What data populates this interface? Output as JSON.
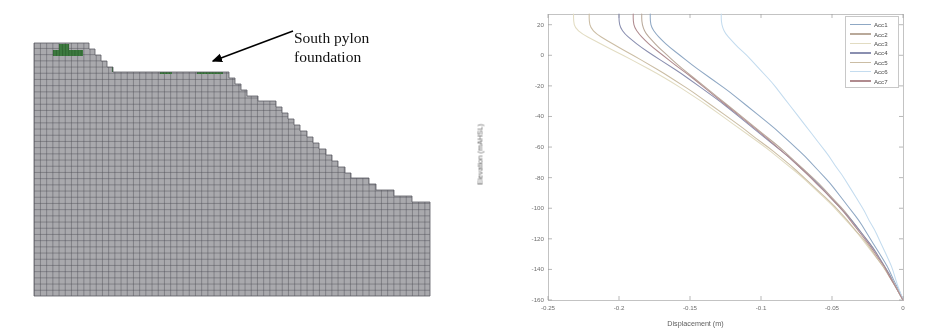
{
  "figure_left": {
    "name": "finite-element-mesh-cross-section",
    "annotation": {
      "line1": "South pylon",
      "line2": "foundation",
      "full_text": "South pylon foundation"
    },
    "mesh": {
      "fill_color": "#a9a9ad",
      "grid_color": "#4a4a52",
      "foundation_color": "#3d7a3f",
      "cell_size_px": 6.2,
      "foundation_blocks": [
        {
          "x": 59,
          "y": 44,
          "w": 10,
          "h": 6
        },
        {
          "x": 53,
          "y": 50,
          "w": 30,
          "h": 6
        },
        {
          "x": 112,
          "y": 67,
          "w": 12,
          "h": 5
        },
        {
          "x": 160,
          "y": 69,
          "w": 12,
          "h": 5
        },
        {
          "x": 197,
          "y": 67,
          "w": 26,
          "h": 7
        }
      ],
      "profile_steps": [
        {
          "x": 34,
          "y": 43
        },
        {
          "x": 83,
          "y": 43
        },
        {
          "x": 89,
          "y": 49
        },
        {
          "x": 95,
          "y": 55
        },
        {
          "x": 101,
          "y": 61
        },
        {
          "x": 107,
          "y": 67
        },
        {
          "x": 113,
          "y": 72
        },
        {
          "x": 223,
          "y": 72
        },
        {
          "x": 229,
          "y": 78
        },
        {
          "x": 235,
          "y": 84
        },
        {
          "x": 241,
          "y": 90
        },
        {
          "x": 247,
          "y": 96
        },
        {
          "x": 258,
          "y": 101
        },
        {
          "x": 270,
          "y": 101
        },
        {
          "x": 276,
          "y": 107
        },
        {
          "x": 282,
          "y": 113
        },
        {
          "x": 288,
          "y": 119
        },
        {
          "x": 294,
          "y": 125
        },
        {
          "x": 300,
          "y": 131
        },
        {
          "x": 307,
          "y": 137
        },
        {
          "x": 313,
          "y": 143
        },
        {
          "x": 319,
          "y": 149
        },
        {
          "x": 326,
          "y": 155
        },
        {
          "x": 332,
          "y": 161
        },
        {
          "x": 338,
          "y": 167
        },
        {
          "x": 345,
          "y": 173
        },
        {
          "x": 351,
          "y": 178
        },
        {
          "x": 363,
          "y": 178
        },
        {
          "x": 369,
          "y": 184
        },
        {
          "x": 376,
          "y": 190
        },
        {
          "x": 388,
          "y": 190
        },
        {
          "x": 394,
          "y": 196
        },
        {
          "x": 406,
          "y": 196
        },
        {
          "x": 412,
          "y": 202
        },
        {
          "x": 424,
          "y": 202
        },
        {
          "x": 430,
          "y": 296
        },
        {
          "x": 34,
          "y": 296
        }
      ]
    }
  },
  "chart_data": {
    "type": "line",
    "title": "",
    "xlabel": "Displacement (m)",
    "ylabel": "Elevation (mAHSL)",
    "xlim": [
      -0.25,
      0.0
    ],
    "ylim": [
      -160,
      27
    ],
    "xticks": [
      -0.25,
      -0.2,
      -0.15,
      -0.1,
      -0.05,
      0
    ],
    "xticklabels": [
      "-0.25",
      "-0.2",
      "-0.15",
      "-0.1",
      "-0.05",
      "0"
    ],
    "yticks": [
      20,
      0,
      -20,
      -40,
      -60,
      -80,
      -100,
      -120,
      -140,
      -160
    ],
    "yticklabels": [
      "20",
      "0",
      "-20",
      "-40",
      "-60",
      "-80",
      "-100",
      "-120",
      "-140",
      "-160"
    ],
    "grid": false,
    "legend_position": "top-right",
    "legend_entries": [
      "Acc1",
      "Acc2",
      "Acc3",
      "Acc4",
      "Acc5",
      "Acc6",
      "Acc7"
    ],
    "series": [
      {
        "name": "Acc1",
        "color": "#8fa8c4",
        "points": [
          [
            -0.178,
            27
          ],
          [
            -0.178,
            22
          ],
          [
            -0.177,
            18
          ],
          [
            -0.174,
            14
          ],
          [
            -0.17,
            10
          ],
          [
            -0.164,
            5
          ],
          [
            -0.157,
            0
          ],
          [
            -0.149,
            -6
          ],
          [
            -0.14,
            -12
          ],
          [
            -0.131,
            -18
          ],
          [
            -0.122,
            -24
          ],
          [
            -0.114,
            -30
          ],
          [
            -0.106,
            -36
          ],
          [
            -0.098,
            -42
          ],
          [
            -0.09,
            -48
          ],
          [
            -0.083,
            -54
          ],
          [
            -0.076,
            -60
          ],
          [
            -0.069,
            -66
          ],
          [
            -0.063,
            -72
          ],
          [
            -0.057,
            -78
          ],
          [
            -0.051,
            -84
          ],
          [
            -0.046,
            -90
          ],
          [
            -0.041,
            -96
          ],
          [
            -0.036,
            -102
          ],
          [
            -0.031,
            -108
          ],
          [
            -0.027,
            -114
          ],
          [
            -0.023,
            -120
          ],
          [
            -0.019,
            -126
          ],
          [
            -0.015,
            -132
          ],
          [
            -0.011,
            -138
          ],
          [
            -0.008,
            -144
          ],
          [
            -0.005,
            -150
          ],
          [
            -0.002,
            -155
          ],
          [
            0.0,
            -160
          ]
        ]
      },
      {
        "name": "Acc2",
        "color": "#b9a99a",
        "points": [
          [
            -0.184,
            27
          ],
          [
            -0.184,
            22
          ],
          [
            -0.183,
            18
          ],
          [
            -0.181,
            14
          ],
          [
            -0.177,
            10
          ],
          [
            -0.172,
            5
          ],
          [
            -0.166,
            0
          ],
          [
            -0.159,
            -6
          ],
          [
            -0.151,
            -12
          ],
          [
            -0.143,
            -18
          ],
          [
            -0.135,
            -24
          ],
          [
            -0.127,
            -30
          ],
          [
            -0.119,
            -36
          ],
          [
            -0.111,
            -42
          ],
          [
            -0.103,
            -48
          ],
          [
            -0.095,
            -54
          ],
          [
            -0.087,
            -60
          ],
          [
            -0.08,
            -66
          ],
          [
            -0.073,
            -72
          ],
          [
            -0.066,
            -78
          ],
          [
            -0.059,
            -84
          ],
          [
            -0.053,
            -90
          ],
          [
            -0.047,
            -96
          ],
          [
            -0.041,
            -102
          ],
          [
            -0.036,
            -108
          ],
          [
            -0.031,
            -114
          ],
          [
            -0.026,
            -120
          ],
          [
            -0.021,
            -126
          ],
          [
            -0.017,
            -132
          ],
          [
            -0.013,
            -138
          ],
          [
            -0.009,
            -144
          ],
          [
            -0.006,
            -150
          ],
          [
            -0.003,
            -155
          ],
          [
            0.0,
            -160
          ]
        ]
      },
      {
        "name": "Acc3",
        "color": "#e2dcc2",
        "points": [
          [
            -0.232,
            27
          ],
          [
            -0.232,
            22
          ],
          [
            -0.231,
            18
          ],
          [
            -0.226,
            14
          ],
          [
            -0.218,
            10
          ],
          [
            -0.208,
            5
          ],
          [
            -0.197,
            0
          ],
          [
            -0.185,
            -6
          ],
          [
            -0.173,
            -12
          ],
          [
            -0.162,
            -18
          ],
          [
            -0.152,
            -24
          ],
          [
            -0.142,
            -30
          ],
          [
            -0.133,
            -36
          ],
          [
            -0.124,
            -42
          ],
          [
            -0.115,
            -48
          ],
          [
            -0.106,
            -54
          ],
          [
            -0.097,
            -60
          ],
          [
            -0.089,
            -66
          ],
          [
            -0.081,
            -72
          ],
          [
            -0.073,
            -78
          ],
          [
            -0.066,
            -84
          ],
          [
            -0.059,
            -90
          ],
          [
            -0.052,
            -96
          ],
          [
            -0.046,
            -102
          ],
          [
            -0.04,
            -108
          ],
          [
            -0.034,
            -114
          ],
          [
            -0.029,
            -120
          ],
          [
            -0.024,
            -126
          ],
          [
            -0.019,
            -132
          ],
          [
            -0.014,
            -138
          ],
          [
            -0.01,
            -144
          ],
          [
            -0.006,
            -150
          ],
          [
            -0.003,
            -155
          ],
          [
            0.0,
            -160
          ]
        ]
      },
      {
        "name": "Acc4",
        "color": "#8a8fb0",
        "points": [
          [
            -0.2,
            27
          ],
          [
            -0.2,
            22
          ],
          [
            -0.199,
            18
          ],
          [
            -0.196,
            14
          ],
          [
            -0.191,
            10
          ],
          [
            -0.184,
            5
          ],
          [
            -0.176,
            0
          ],
          [
            -0.166,
            -6
          ],
          [
            -0.156,
            -12
          ],
          [
            -0.147,
            -18
          ],
          [
            -0.138,
            -24
          ],
          [
            -0.129,
            -30
          ],
          [
            -0.121,
            -36
          ],
          [
            -0.113,
            -42
          ],
          [
            -0.105,
            -48
          ],
          [
            -0.097,
            -54
          ],
          [
            -0.089,
            -60
          ],
          [
            -0.081,
            -66
          ],
          [
            -0.074,
            -72
          ],
          [
            -0.067,
            -78
          ],
          [
            -0.06,
            -84
          ],
          [
            -0.054,
            -90
          ],
          [
            -0.048,
            -96
          ],
          [
            -0.042,
            -102
          ],
          [
            -0.036,
            -108
          ],
          [
            -0.031,
            -114
          ],
          [
            -0.026,
            -120
          ],
          [
            -0.021,
            -126
          ],
          [
            -0.017,
            -132
          ],
          [
            -0.013,
            -138
          ],
          [
            -0.009,
            -144
          ],
          [
            -0.006,
            -150
          ],
          [
            -0.003,
            -155
          ],
          [
            0.0,
            -160
          ]
        ]
      },
      {
        "name": "Acc5",
        "color": "#cbbda4",
        "points": [
          [
            -0.221,
            27
          ],
          [
            -0.221,
            22
          ],
          [
            -0.22,
            18
          ],
          [
            -0.216,
            14
          ],
          [
            -0.209,
            10
          ],
          [
            -0.2,
            5
          ],
          [
            -0.19,
            0
          ],
          [
            -0.179,
            -6
          ],
          [
            -0.168,
            -12
          ],
          [
            -0.158,
            -18
          ],
          [
            -0.148,
            -24
          ],
          [
            -0.139,
            -30
          ],
          [
            -0.13,
            -36
          ],
          [
            -0.121,
            -42
          ],
          [
            -0.112,
            -48
          ],
          [
            -0.104,
            -54
          ],
          [
            -0.095,
            -60
          ],
          [
            -0.087,
            -66
          ],
          [
            -0.079,
            -72
          ],
          [
            -0.072,
            -78
          ],
          [
            -0.065,
            -84
          ],
          [
            -0.058,
            -90
          ],
          [
            -0.051,
            -96
          ],
          [
            -0.045,
            -102
          ],
          [
            -0.039,
            -108
          ],
          [
            -0.034,
            -114
          ],
          [
            -0.028,
            -120
          ],
          [
            -0.023,
            -126
          ],
          [
            -0.019,
            -132
          ],
          [
            -0.014,
            -138
          ],
          [
            -0.01,
            -144
          ],
          [
            -0.006,
            -150
          ],
          [
            -0.003,
            -155
          ],
          [
            0.0,
            -160
          ]
        ]
      },
      {
        "name": "Acc6",
        "color": "#c4dcef",
        "points": [
          [
            -0.128,
            27
          ],
          [
            -0.128,
            22
          ],
          [
            -0.127,
            18
          ],
          [
            -0.125,
            14
          ],
          [
            -0.121,
            10
          ],
          [
            -0.116,
            5
          ],
          [
            -0.11,
            0
          ],
          [
            -0.104,
            -6
          ],
          [
            -0.098,
            -12
          ],
          [
            -0.092,
            -18
          ],
          [
            -0.087,
            -24
          ],
          [
            -0.082,
            -30
          ],
          [
            -0.077,
            -36
          ],
          [
            -0.072,
            -42
          ],
          [
            -0.067,
            -48
          ],
          [
            -0.062,
            -54
          ],
          [
            -0.057,
            -60
          ],
          [
            -0.052,
            -66
          ],
          [
            -0.048,
            -72
          ],
          [
            -0.043,
            -78
          ],
          [
            -0.039,
            -84
          ],
          [
            -0.035,
            -90
          ],
          [
            -0.031,
            -96
          ],
          [
            -0.027,
            -102
          ],
          [
            -0.024,
            -108
          ],
          [
            -0.02,
            -114
          ],
          [
            -0.017,
            -120
          ],
          [
            -0.014,
            -126
          ],
          [
            -0.011,
            -132
          ],
          [
            -0.008,
            -138
          ],
          [
            -0.006,
            -144
          ],
          [
            -0.004,
            -150
          ],
          [
            -0.002,
            -155
          ],
          [
            0.0,
            -160
          ]
        ]
      },
      {
        "name": "Acc7",
        "color": "#b08b8f",
        "points": [
          [
            -0.19,
            27
          ],
          [
            -0.19,
            22
          ],
          [
            -0.189,
            18
          ],
          [
            -0.186,
            14
          ],
          [
            -0.182,
            10
          ],
          [
            -0.176,
            5
          ],
          [
            -0.169,
            0
          ],
          [
            -0.161,
            -6
          ],
          [
            -0.152,
            -12
          ],
          [
            -0.144,
            -18
          ],
          [
            -0.136,
            -24
          ],
          [
            -0.128,
            -30
          ],
          [
            -0.12,
            -36
          ],
          [
            -0.112,
            -42
          ],
          [
            -0.104,
            -48
          ],
          [
            -0.096,
            -54
          ],
          [
            -0.089,
            -60
          ],
          [
            -0.081,
            -66
          ],
          [
            -0.074,
            -72
          ],
          [
            -0.067,
            -78
          ],
          [
            -0.061,
            -84
          ],
          [
            -0.054,
            -90
          ],
          [
            -0.048,
            -96
          ],
          [
            -0.042,
            -102
          ],
          [
            -0.037,
            -108
          ],
          [
            -0.032,
            -114
          ],
          [
            -0.027,
            -120
          ],
          [
            -0.022,
            -126
          ],
          [
            -0.018,
            -132
          ],
          [
            -0.013,
            -138
          ],
          [
            -0.01,
            -144
          ],
          [
            -0.006,
            -150
          ],
          [
            -0.003,
            -155
          ],
          [
            0.0,
            -160
          ]
        ]
      }
    ]
  }
}
